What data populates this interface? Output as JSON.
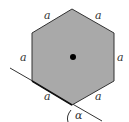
{
  "diagram": {
    "shape": "regular hexagon",
    "fill_color": "#a9a9a9",
    "stroke_color": "#333333",
    "side_labels": [
      {
        "id": "top-left",
        "text": "a",
        "x": 44,
        "y": 19
      },
      {
        "id": "top-right",
        "text": "a",
        "x": 95,
        "y": 19
      },
      {
        "id": "left",
        "text": "a",
        "x": 20,
        "y": 61
      },
      {
        "id": "right",
        "text": "a",
        "x": 117,
        "y": 61
      },
      {
        "id": "bottom-left",
        "text": "a",
        "x": 44,
        "y": 100
      },
      {
        "id": "bottom-right",
        "text": "a",
        "x": 95,
        "y": 100
      }
    ],
    "angle_label": {
      "text": "α",
      "x": 75,
      "y": 118
    },
    "center_dot": {
      "cx": 73,
      "cy": 57,
      "r": 3
    }
  }
}
